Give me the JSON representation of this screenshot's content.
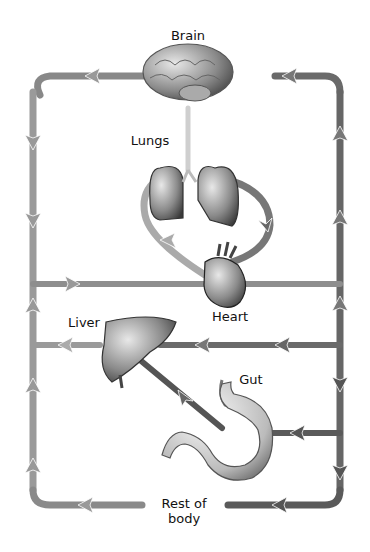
{
  "labels": {
    "brain": "Brain",
    "lungs": "Lungs",
    "heart": "Heart",
    "liver": "Liver",
    "gut": "Gut",
    "rest_of_body_line1": "Rest of",
    "rest_of_body_line2": "body"
  },
  "colors": {
    "vessel_light": "#a8a8a8",
    "vessel_dark": "#555555",
    "organ": "#8a8a8a",
    "text": "#111111",
    "background": "#ffffff"
  },
  "organs": [
    "brain",
    "lungs",
    "heart",
    "liver",
    "gut"
  ],
  "icons": [
    "brain-icon",
    "lungs-icon",
    "heart-icon",
    "liver-icon",
    "stomach-icon",
    "arrow-icon"
  ]
}
